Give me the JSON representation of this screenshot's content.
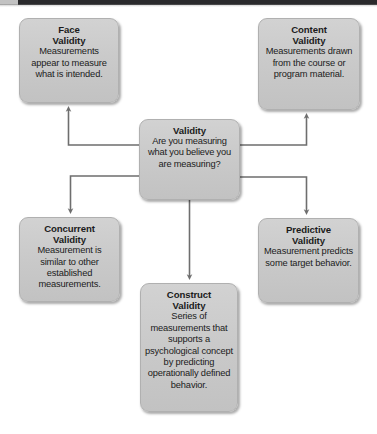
{
  "diagram": {
    "type": "concept-map",
    "title_node": "Validity",
    "background_color": "#ffffff",
    "node_fill_color": "#cacaca",
    "node_border_color": "#b0b0b0",
    "connector_color": "#6e6e6e",
    "top_bar_color": "#2a2a2c",
    "top_bar_left_color": "#c2c2c2"
  },
  "nodes": {
    "face": {
      "title": "Face\nValidity",
      "title_line1": "Face",
      "title_line2": "Validity",
      "body": "Measurements appear to measure what is intended."
    },
    "content": {
      "title_line1": "Content",
      "title_line2": "Validity",
      "body": "Measurements drawn from the course or program material."
    },
    "validity": {
      "title_line1": "Validity",
      "body": "Are you measuring what you believe you are measuring?"
    },
    "concurrent": {
      "title_line1": "Concurrent",
      "title_line2": "Validity",
      "body": "Measurement is similar to other established measurements."
    },
    "predictive": {
      "title_line1": "Predictive",
      "title_line2": "Validity",
      "body": "Measurement predicts some target behavior."
    },
    "construct": {
      "title_line1": "Construct",
      "title_line2": "Validity",
      "body": "Series of measurements that supports a psychological concept by predicting operationally defined behavior."
    }
  },
  "connections": [
    {
      "from": "validity",
      "to": "face",
      "label": ""
    },
    {
      "from": "validity",
      "to": "content",
      "label": ""
    },
    {
      "from": "validity",
      "to": "concurrent",
      "label": ""
    },
    {
      "from": "validity",
      "to": "predictive",
      "label": ""
    },
    {
      "from": "validity",
      "to": "construct",
      "label": ""
    }
  ]
}
